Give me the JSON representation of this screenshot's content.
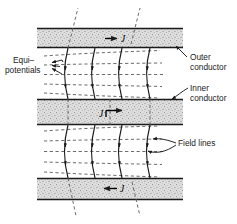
{
  "figure": {
    "background_color": "#ffffff",
    "line_color": "#1a1a1a",
    "dash_color": "#5a5a5a",
    "conductor_fill": "#d9d9d9",
    "conductor_stipple": "#8a8a8a"
  },
  "labels": {
    "equipotentials": {
      "line1": "Equi–",
      "line2": "potentials"
    },
    "outer_conductor": {
      "line1": "Outer",
      "line2": "conductor"
    },
    "inner_conductor": {
      "line1": "Inner",
      "line2": "conductor"
    },
    "field_lines": "Field lines"
  },
  "current_arrows": [
    {
      "id": "top",
      "symbol": "J",
      "direction": "right",
      "order": "arrow-then-symbol",
      "band": "outer-conductor-top"
    },
    {
      "id": "middle",
      "symbol": "J",
      "direction": "right",
      "order": "symbol-then-arrow",
      "band": "inner-conductor"
    },
    {
      "id": "bottom",
      "symbol": "J",
      "direction": "left",
      "order": "arrow-then-symbol",
      "band": "outer-conductor-bottom"
    }
  ],
  "conductor_bands": [
    {
      "id": "outer-top",
      "x": 37,
      "y": 28,
      "width": 146,
      "height": 20
    },
    {
      "id": "inner",
      "x": 37,
      "y": 99,
      "width": 146,
      "height": 26
    },
    {
      "id": "outer-bottom",
      "x": 37,
      "y": 178,
      "width": 146,
      "height": 22
    }
  ],
  "field_regions": [
    {
      "id": "upper-gap",
      "top": 48,
      "bottom": 99
    },
    {
      "id": "lower-gap",
      "top": 125,
      "bottom": 178
    }
  ],
  "counts": {
    "field_lines_per_gap": 4,
    "equipotentials_per_gap": 5,
    "conductor_bands": 3
  }
}
